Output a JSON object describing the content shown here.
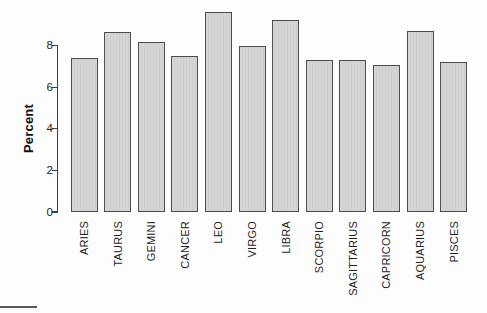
{
  "chart_data": {
    "type": "bar",
    "title": "",
    "xlabel": "",
    "ylabel": "Percent",
    "categories": [
      "ARIES",
      "TAURUS",
      "GEMINI",
      "CANCER",
      "LEO",
      "VIRGO",
      "LIBRA",
      "SCORPIO",
      "SAGITTARIUS",
      "CAPRICORN",
      "AQUARIUS",
      "PISCES"
    ],
    "values": [
      7.4,
      8.65,
      8.15,
      7.5,
      9.6,
      8.0,
      9.25,
      7.3,
      7.3,
      7.05,
      8.7,
      7.2
    ],
    "yticks": [
      0,
      2,
      4,
      6,
      8
    ],
    "ylim": [
      0,
      9.8
    ],
    "grid": false,
    "legend": false,
    "colors": {
      "bar_fill": "#d3d3d3",
      "bar_border": "#4d4d4d",
      "axis": "#3f3f3f",
      "text": "#1f1f1f",
      "background": "#fdfdfd"
    }
  }
}
